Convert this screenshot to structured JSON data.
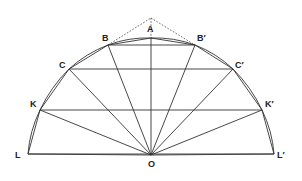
{
  "figure": {
    "type": "geometric-construction",
    "center": {
      "label": "O",
      "x": 151,
      "y": 155
    },
    "points": [
      {
        "id": "L",
        "label": "L",
        "x": 28,
        "y": 154,
        "label_dx": -13,
        "label_dy": 4
      },
      {
        "id": "K",
        "label": "K",
        "x": 40,
        "y": 110,
        "label_dx": -10,
        "label_dy": -3
      },
      {
        "id": "C",
        "label": "C",
        "x": 69,
        "y": 69,
        "label_dx": -10,
        "label_dy": -1
      },
      {
        "id": "B",
        "label": "B",
        "x": 108,
        "y": 45,
        "label_dx": -6,
        "label_dy": -4
      },
      {
        "id": "A",
        "label": "A",
        "x": 151,
        "y": 38,
        "label_dx": -4,
        "label_dy": -6
      },
      {
        "id": "Bp",
        "label": "B′",
        "x": 195,
        "y": 45,
        "label_dx": 2,
        "label_dy": -4
      },
      {
        "id": "Cp",
        "label": "C′",
        "x": 233,
        "y": 69,
        "label_dx": 2,
        "label_dy": -1
      },
      {
        "id": "Kp",
        "label": "K′",
        "x": 262,
        "y": 110,
        "label_dx": 3,
        "label_dy": -3
      },
      {
        "id": "Lp",
        "label": "L′",
        "x": 274,
        "y": 154,
        "label_dx": 3,
        "label_dy": 4
      }
    ],
    "apex": {
      "x": 151,
      "y": 18
    },
    "chords": [
      [
        "B",
        "Bp"
      ],
      [
        "C",
        "Cp"
      ],
      [
        "K",
        "Kp"
      ],
      [
        "L",
        "Lp"
      ]
    ],
    "polygon": [
      "L",
      "K",
      "C",
      "B",
      "A",
      "Bp",
      "Cp",
      "Kp",
      "Lp"
    ],
    "radii": [
      "L",
      "K",
      "C",
      "B",
      "A",
      "Bp",
      "Cp",
      "Kp",
      "Lp"
    ],
    "dashed": [
      [
        "B",
        "apex"
      ],
      [
        "apex",
        "Bp"
      ],
      [
        "apex",
        "A"
      ]
    ],
    "labels": {
      "O": "O"
    },
    "colors": {
      "line": "#333333",
      "background": "#ffffff"
    }
  }
}
